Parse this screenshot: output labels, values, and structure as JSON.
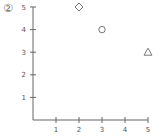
{
  "badge": {
    "label": "②"
  },
  "chart_data": {
    "type": "scatter",
    "title": "",
    "xlabel": "",
    "ylabel": "",
    "xlim": [
      0,
      5
    ],
    "ylim": [
      0,
      5
    ],
    "grid": false,
    "legend": null,
    "x_ticks": [
      1,
      2,
      3,
      4,
      5
    ],
    "y_ticks": [
      1,
      2,
      3,
      4,
      5
    ],
    "series": [
      {
        "name": "diamond",
        "marker": "diamond",
        "points": [
          {
            "x": 2,
            "y": 5
          }
        ]
      },
      {
        "name": "circle",
        "marker": "circle",
        "points": [
          {
            "x": 3,
            "y": 4
          }
        ]
      },
      {
        "name": "triangle",
        "marker": "triangle",
        "points": [
          {
            "x": 5,
            "y": 3
          }
        ]
      }
    ]
  },
  "colors": {
    "axis": "#666666",
    "marker": "#777777",
    "text": "#555555"
  }
}
